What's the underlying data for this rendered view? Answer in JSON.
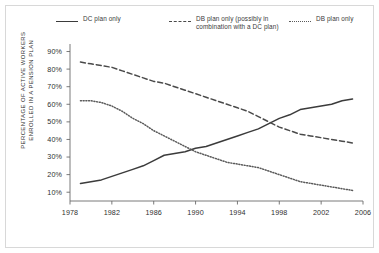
{
  "chart_data": {
    "type": "line",
    "title": "",
    "xlabel": "",
    "ylabel": "PERCENTAGE OF ACTIVE WORKERS\nENROLLED IN A PENSION PLAN",
    "xlim": [
      1978,
      2006
    ],
    "ylim": [
      5,
      92
    ],
    "grid": false,
    "legend_position": "top",
    "xticks": [
      "1978",
      "1982",
      "1986",
      "1990",
      "1994",
      "1998",
      "2002",
      "2006"
    ],
    "xtick_values": [
      1978,
      1982,
      1986,
      1990,
      1994,
      1998,
      2002,
      2006
    ],
    "yticks": [
      "10%",
      "20%",
      "30%",
      "40%",
      "50%",
      "60%",
      "70%",
      "80%",
      "90%"
    ],
    "ytick_values": [
      10,
      20,
      30,
      40,
      50,
      60,
      70,
      80,
      90
    ],
    "x": [
      1979,
      1980,
      1981,
      1982,
      1983,
      1984,
      1985,
      1986,
      1987,
      1988,
      1989,
      1990,
      1991,
      1992,
      1993,
      1994,
      1995,
      1996,
      1997,
      1998,
      1999,
      2000,
      2001,
      2002,
      2003,
      2004,
      2005
    ],
    "series": [
      {
        "name": "DC plan only",
        "style": "solid",
        "color": "#3b3b3b",
        "values": [
          15,
          16,
          17,
          19,
          21,
          23,
          25,
          28,
          31,
          32,
          33,
          35,
          36,
          38,
          40,
          42,
          44,
          46,
          49,
          52,
          54,
          57,
          58,
          59,
          60,
          62,
          63
        ]
      },
      {
        "name": "DB plan only (possibly in combination with a DC plan)",
        "style": "dashed",
        "color": "#4a4a4a",
        "values": [
          84,
          83,
          82,
          81,
          79,
          77,
          75,
          73,
          72,
          70,
          68,
          66,
          64,
          62,
          60,
          58,
          56,
          53,
          50,
          47,
          45,
          43,
          42,
          41,
          40,
          39,
          38
        ]
      },
      {
        "name": "DB plan only",
        "style": "dotted",
        "color": "#5a5a5a",
        "values": [
          62,
          62,
          61,
          59,
          56,
          52,
          49,
          45,
          42,
          39,
          36,
          33,
          31,
          29,
          27,
          26,
          25,
          24,
          22,
          20,
          18,
          16,
          15,
          14,
          13,
          12,
          11
        ]
      }
    ],
    "annotations": []
  },
  "legend": {
    "items": [
      {
        "label": "DC plan only",
        "style": "solid"
      },
      {
        "label": "DB plan only (possibly in\ncombination with a DC plan)",
        "style": "dashed"
      },
      {
        "label": "DB plan only",
        "style": "dotted"
      }
    ]
  }
}
